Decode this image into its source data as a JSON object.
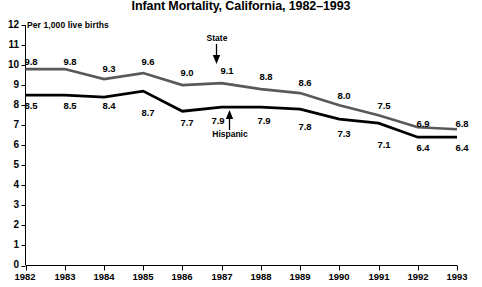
{
  "chart_data": {
    "type": "line",
    "title": "Infant Mortality, California, 1982–1993",
    "subtitle": "Per 1,000 live births",
    "xlabel": "",
    "ylabel": "",
    "ylim": [
      0,
      12
    ],
    "yticks": [
      "0",
      "1",
      "2",
      "3",
      "4",
      "5",
      "6",
      "7",
      "8",
      "9",
      "10",
      "11",
      "12"
    ],
    "grid": false,
    "legend_position": "inline-annotations",
    "categories": [
      "1982",
      "1983",
      "1984",
      "1985",
      "1986",
      "1987",
      "1988",
      "1989",
      "1990",
      "1991",
      "1992",
      "1993"
    ],
    "series": [
      {
        "name": "State",
        "color": "#595959",
        "values": [
          9.8,
          9.8,
          9.3,
          9.6,
          9.0,
          9.1,
          8.8,
          8.6,
          8.0,
          7.5,
          6.9,
          6.8
        ],
        "labels": [
          "9.8",
          "9.8",
          "9.3",
          "9.6",
          "9.0",
          "9.1",
          "8.8",
          "8.6",
          "8.0",
          "7.5",
          "6.9",
          "6.8"
        ]
      },
      {
        "name": "Hispanic",
        "color": "#000000",
        "values": [
          8.5,
          8.5,
          8.4,
          8.7,
          7.7,
          7.9,
          7.9,
          7.8,
          7.3,
          7.1,
          6.4,
          6.4
        ],
        "labels": [
          "8.5",
          "8.5",
          "8.4",
          "8.7",
          "7.7",
          "7.9",
          "7.9",
          "7.8",
          "7.3",
          "7.1",
          "6.4",
          "6.4"
        ]
      }
    ],
    "annotations": [
      {
        "text": "State",
        "arrow": "down",
        "points_to_series": "State",
        "near_year": "1987"
      },
      {
        "text": "Hispanic",
        "arrow": "up",
        "points_to_series": "Hispanic",
        "near_year": "1988"
      }
    ]
  },
  "axis": {
    "y_tick_0": "0",
    "y_tick_1": "1",
    "y_tick_2": "2",
    "y_tick_3": "3",
    "y_tick_4": "4",
    "y_tick_5": "5",
    "y_tick_6": "6",
    "y_tick_7": "7",
    "y_tick_8": "8",
    "y_tick_9": "9",
    "y_tick_10": "10",
    "y_tick_11": "11",
    "y_tick_12": "12"
  }
}
